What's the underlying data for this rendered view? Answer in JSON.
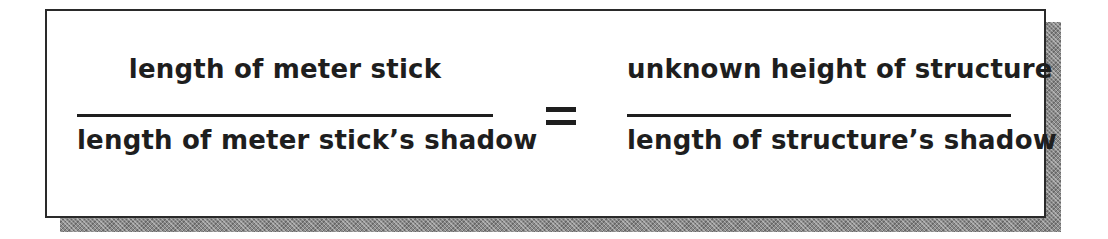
{
  "equation": {
    "left_fraction": {
      "numerator": "length of meter stick",
      "denominator": "length of meter stick’s shadow"
    },
    "operator": "=",
    "right_fraction": {
      "numerator": "unknown height of structure",
      "denominator": "length of structure’s shadow"
    }
  },
  "colors": {
    "text": "#1e1e1e",
    "border": "#2a2a2a",
    "shadow": "#8a8a8a",
    "background": "#ffffff"
  }
}
